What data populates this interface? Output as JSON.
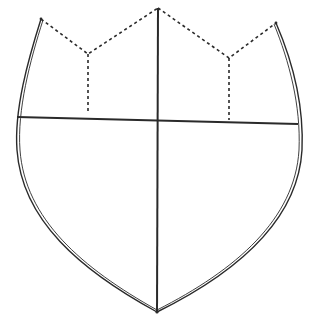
{
  "diagram": {
    "type": "heraldic-shield-outline",
    "colors": {
      "background": "#ffffff",
      "line": "#2a2a2a"
    },
    "elements": {
      "outline": {
        "style": "double-line",
        "points": {
          "top_left": [
            41,
            19
          ],
          "top_right": [
            276,
            23
          ],
          "base": [
            157,
            312
          ]
        }
      },
      "top_dashed_edge": {
        "style": "dashed",
        "points": [
          [
            41,
            19
          ],
          [
            88,
            54
          ],
          [
            158,
            8
          ],
          [
            229,
            58
          ],
          [
            276,
            23
          ]
        ]
      },
      "left_dashed_drop": {
        "style": "dashed",
        "from": [
          88,
          54
        ],
        "to": [
          88,
          113
        ]
      },
      "right_dashed_drop": {
        "style": "dashed",
        "from": [
          229,
          58
        ],
        "to": [
          229,
          120
        ]
      },
      "chief_line": {
        "style": "solid",
        "from": [
          17,
          117
        ],
        "to": [
          298,
          124
        ]
      },
      "pale_line": {
        "style": "solid",
        "from": [
          158,
          8
        ],
        "to": [
          157,
          312
        ]
      }
    }
  }
}
